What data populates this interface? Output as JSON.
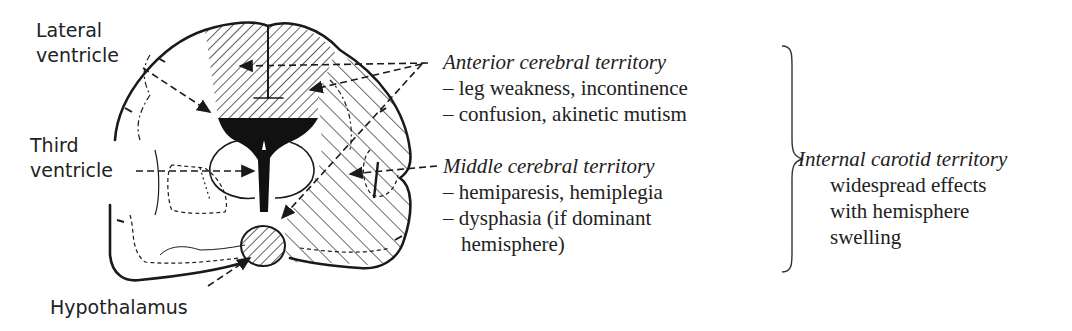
{
  "diagram": {
    "labels": {
      "lateral_ventricle": [
        "Lateral",
        "ventricle"
      ],
      "third_ventricle": [
        "Third",
        "ventricle"
      ],
      "hypothalamus": "Hypothalamus"
    },
    "territories": {
      "anterior": {
        "title": "Anterior cerebral territory",
        "effects": [
          "– leg weakness, incontinence",
          "– confusion, akinetic mutism"
        ]
      },
      "middle": {
        "title": "Middle cerebral territory",
        "effects": [
          "– hemiparesis, hemiplegia",
          "– dysphasia (if dominant",
          "hemisphere)"
        ]
      },
      "internal_carotid": {
        "title": "Internal carotid territory",
        "effects": [
          "widespread effects",
          "with hemisphere",
          "swelling"
        ]
      }
    },
    "colors": {
      "ink": "#1a1a1a",
      "background": "#ffffff"
    }
  }
}
